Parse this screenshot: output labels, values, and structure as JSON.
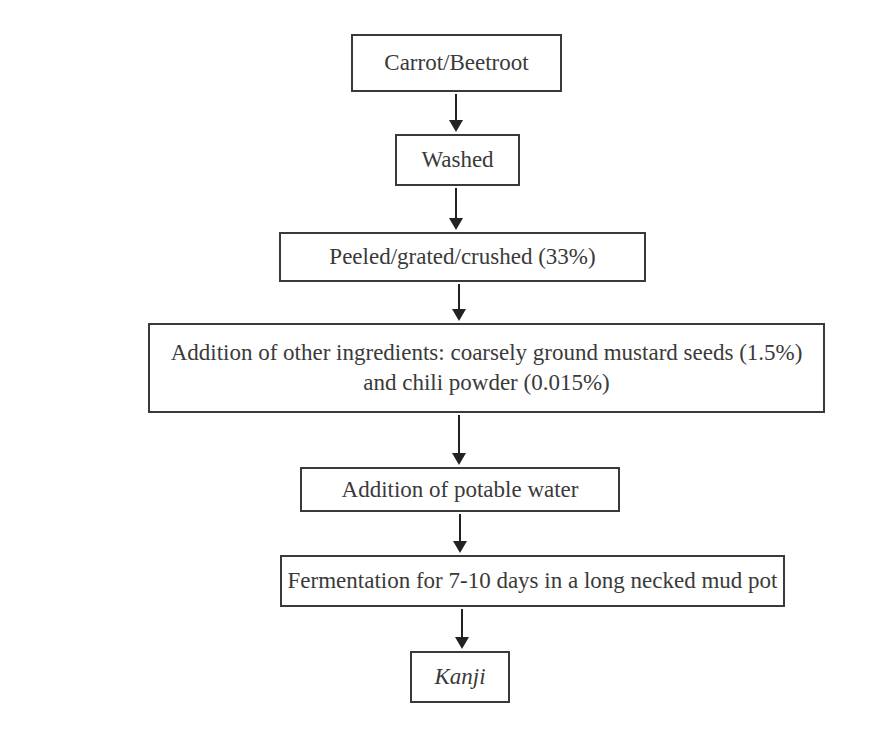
{
  "flowchart": {
    "steps": [
      {
        "label": "Carrot/Beetroot",
        "italic": false
      },
      {
        "label": "Washed",
        "italic": false
      },
      {
        "label": "Peeled/grated/crushed (33%)",
        "italic": false
      },
      {
        "label": "Addition of other ingredients: coarsely ground mustard seeds (1.5%)",
        "label_line2": "and chili powder (0.015%)",
        "italic": false
      },
      {
        "label": "Addition of potable water",
        "italic": false
      },
      {
        "label": "Fermentation for 7-10 days in a long necked mud pot",
        "italic": false
      },
      {
        "label": "Kanji",
        "italic": true
      }
    ],
    "arrows": [
      {
        "from": 0,
        "to": 1
      },
      {
        "from": 1,
        "to": 2
      },
      {
        "from": 2,
        "to": 3
      },
      {
        "from": 3,
        "to": 4
      },
      {
        "from": 4,
        "to": 5
      },
      {
        "from": 5,
        "to": 6
      }
    ]
  }
}
